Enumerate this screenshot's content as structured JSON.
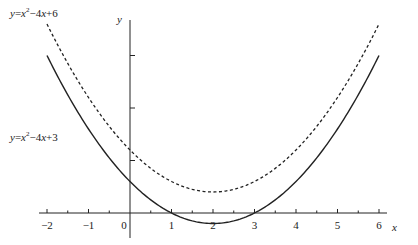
{
  "chart_data": {
    "type": "line",
    "title": "",
    "xlabel": "x",
    "ylabel": "y",
    "xlim": [
      -2,
      6
    ],
    "ylim": [
      -1,
      18
    ],
    "x_ticks": [
      -2,
      -1,
      0,
      1,
      2,
      3,
      4,
      5,
      6
    ],
    "x_tick_labels": [
      "−2",
      "−1",
      "0",
      "1",
      "2",
      "3",
      "4",
      "5",
      "6"
    ],
    "y_ticks_unlabeled": [
      5,
      10,
      15
    ],
    "grid": false,
    "legend": "none (inline labels)",
    "series": [
      {
        "name": "y=x²−4x+6",
        "style": "dashed",
        "color": "#222222",
        "x": [
          -2,
          -1,
          0,
          1,
          2,
          3,
          4,
          5,
          6
        ],
        "y": [
          18,
          11,
          6,
          3,
          2,
          3,
          6,
          11,
          18
        ]
      },
      {
        "name": "y=x²−4x+3",
        "style": "solid",
        "color": "#222222",
        "x": [
          -2,
          -1,
          0,
          1,
          2,
          3,
          4,
          5,
          6
        ],
        "y": [
          15,
          8,
          3,
          0,
          -1,
          0,
          3,
          8,
          15
        ]
      }
    ]
  },
  "labels": {
    "upper_curve": {
      "pre": "y",
      "eq": "=",
      "x": "x",
      "exp": "2",
      "rest": "−4",
      "x2": "x",
      "tail": "+6"
    },
    "lower_curve": {
      "pre": "y",
      "eq": "=",
      "x": "x",
      "exp": "2",
      "rest": "−4",
      "x2": "x",
      "tail": "+3"
    },
    "x_axis": "x",
    "y_axis": "y"
  },
  "colors": {
    "ink": "#222222",
    "background": "#ffffff"
  }
}
